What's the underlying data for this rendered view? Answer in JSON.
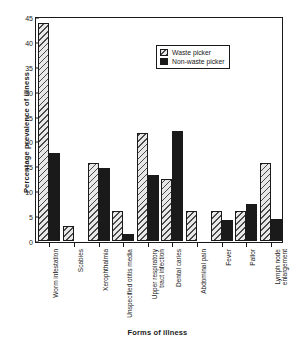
{
  "chart_data": {
    "type": "bar",
    "title": "",
    "xlabel": "Forms of illness",
    "ylabel": "Percentage prevalence of illness",
    "ylim": [
      0,
      45
    ],
    "yticks": [
      0,
      5,
      10,
      15,
      20,
      25,
      30,
      35,
      40,
      45
    ],
    "grid": false,
    "legend_position": "top-right",
    "categories": [
      "Worm infestation",
      "Scabies",
      "Xerophthalmia",
      "Unspecified otitis media",
      "Upper respiratory\ntract infection",
      "Dental caries",
      "Abdominal pain",
      "Fever",
      "Pallor",
      "Lymph node\nenlargement"
    ],
    "series": [
      {
        "name": "Waste picker",
        "fill": "hatched",
        "color": "#e8e8e8",
        "values": [
          43.8,
          3.1,
          15.6,
          6.1,
          21.8,
          12.5,
          6.1,
          6.1,
          6.1,
          15.7
        ]
      },
      {
        "name": "Non-waste picker",
        "fill": "solid",
        "color": "#1a1a1a",
        "values": [
          17.7,
          0,
          14.7,
          1.4,
          13.2,
          22.1,
          0,
          4.3,
          7.5,
          4.4
        ]
      }
    ]
  },
  "legend": {
    "items": [
      {
        "label": "Waste picker"
      },
      {
        "label": "Non-waste picker"
      }
    ]
  }
}
